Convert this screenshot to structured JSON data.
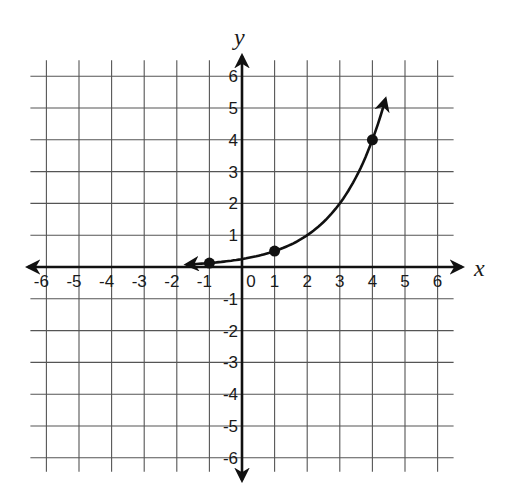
{
  "chart_data": {
    "type": "line",
    "title": "",
    "xlabel": "x",
    "ylabel": "y",
    "xlim": [
      -6,
      6
    ],
    "ylim": [
      -6,
      6
    ],
    "grid": true,
    "x_ticks": [
      "-6",
      "-5",
      "-4",
      "-3",
      "-2",
      "-1",
      "0",
      "1",
      "2",
      "3",
      "4",
      "5",
      "6"
    ],
    "y_ticks": [
      "6",
      "5",
      "4",
      "3",
      "2",
      "1",
      "-1",
      "-2",
      "-3",
      "-4",
      "-5",
      "-6"
    ],
    "origin_label": "0",
    "series": [
      {
        "name": "exponential curve",
        "function": "y = 0.25 * 2^x (approx.)",
        "arrow_left": true,
        "arrow_right": true,
        "curve_range": [
          -1.7,
          4.4
        ],
        "points": [
          {
            "x": -1,
            "y": 0.125
          },
          {
            "x": 1,
            "y": 0.5
          },
          {
            "x": 4,
            "y": 4
          }
        ]
      }
    ]
  }
}
